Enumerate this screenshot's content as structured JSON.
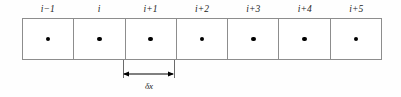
{
  "figure": {
    "colors": {
      "background": "#ffffff",
      "cell_border": "#8d8d8d",
      "node_dot": "#000000",
      "dimension_line": "#000000",
      "extension_line": "#6a6a6a",
      "text": "#1b1b1b"
    }
  },
  "cells": [
    {
      "label": "i−1",
      "node": "node-dot"
    },
    {
      "label": "i",
      "node": "node-dot"
    },
    {
      "label": "i+1",
      "node": "node-dot"
    },
    {
      "label": "i+2",
      "node": "node-dot"
    },
    {
      "label": "i+3",
      "node": "node-dot"
    },
    {
      "label": "i+4",
      "node": "node-dot"
    },
    {
      "label": "i+5",
      "node": "node-dot"
    }
  ],
  "dimension": {
    "label": "δx",
    "spans_cell_index": 2,
    "spans_cell_label": "i+1",
    "arrow_style": "double-headed"
  }
}
